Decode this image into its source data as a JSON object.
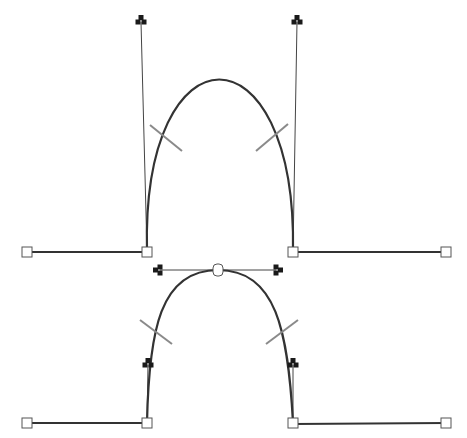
{
  "diagram": {
    "type": "bezier-path-illustration",
    "colors": {
      "curve": "#333333",
      "handle": "#444444",
      "tangent_mark": "#8a8a8a",
      "control_point": "#1a1a1a"
    },
    "top_path": {
      "description": "Corner anchors with vertical handles",
      "anchors": [
        [
          27,
          252
        ],
        [
          147,
          252
        ],
        [
          293,
          252
        ],
        [
          446,
          252
        ]
      ],
      "control_points": [
        [
          141,
          22
        ],
        [
          297,
          22
        ]
      ],
      "apex": [
        220,
        96
      ]
    },
    "bottom_path": {
      "description": "Smooth apex anchor with horizontal handles",
      "anchors": [
        [
          27,
          423
        ],
        [
          147,
          423
        ],
        [
          293,
          423
        ],
        [
          446,
          423
        ]
      ],
      "smooth_anchor": [
        218,
        270
      ],
      "control_points": [
        [
          160,
          270
        ],
        [
          276,
          270
        ],
        [
          148,
          365
        ],
        [
          293,
          365
        ]
      ]
    }
  }
}
